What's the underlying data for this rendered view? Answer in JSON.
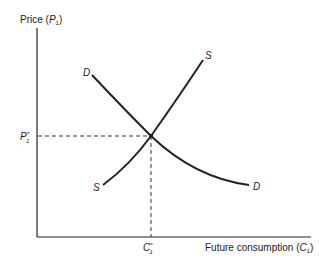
{
  "diagram": {
    "y_axis_label": "Price",
    "y_axis_symbol": "P",
    "y_axis_sub": "1",
    "x_axis_label": "Future consumption",
    "x_axis_symbol": "C",
    "x_axis_sub": "1",
    "equilibrium_price_label": "P",
    "equilibrium_price_sub": "1",
    "equilibrium_qty_label": "C",
    "equilibrium_qty_sub": "1",
    "star": "*",
    "supply_label_top": "S",
    "supply_label_bottom": "S",
    "demand_label_top": "D",
    "demand_label_bottom": "D",
    "line_color": "#222222"
  }
}
